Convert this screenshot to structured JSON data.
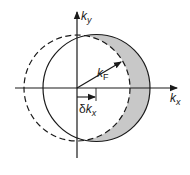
{
  "diagram": {
    "axes": {
      "x_label": {
        "main": "k",
        "sub": "x"
      },
      "y_label": {
        "main": "k",
        "sub": "y"
      }
    },
    "labels": {
      "fermi_radius": {
        "main": "k",
        "sub": "F"
      },
      "shift": {
        "prefix": "δ",
        "main": "k",
        "sub": "x"
      }
    },
    "elements": [
      {
        "id": "equilibrium-circle",
        "style": "dashed",
        "center": [
          77,
          88
        ],
        "radius": 53
      },
      {
        "id": "shifted-circle",
        "style": "solid",
        "center": [
          96.5,
          88
        ],
        "radius": 53.5
      },
      {
        "id": "crescent-region",
        "fill": "#c8c8c8",
        "description": "area of shifted circle outside original circle"
      }
    ],
    "colors": {
      "line": "#1a1a1a",
      "shade": "#c8c8c8",
      "background": "#ffffff"
    }
  }
}
